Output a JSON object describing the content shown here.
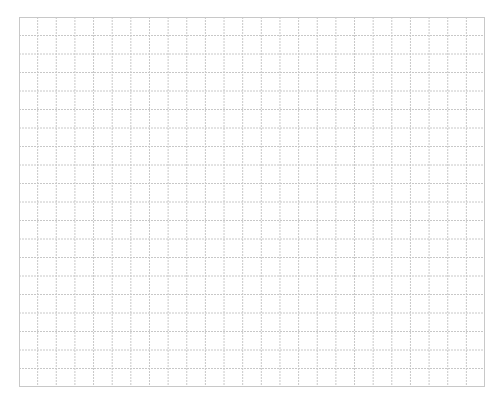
{
  "canvas": {
    "width": 504,
    "height": 408,
    "background": "#ffffff"
  },
  "header": {
    "clipped_text": ""
  },
  "grid": {
    "left": 19,
    "top": 17,
    "width": 466,
    "height": 370,
    "columns": 25,
    "rows": 20,
    "line_color": "#c8c8c8",
    "line_style": "dotted"
  }
}
